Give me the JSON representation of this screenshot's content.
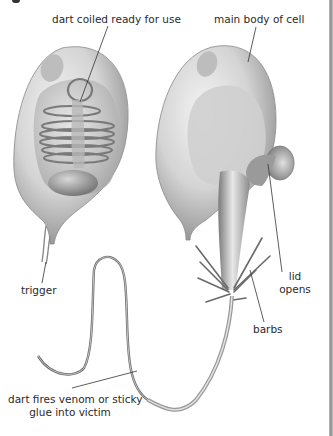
{
  "diagram": {
    "labels": {
      "dart_coiled": "dart coiled ready for use",
      "main_body": "main body of cell",
      "trigger": "trigger",
      "lid_line1": "lid",
      "lid_line2": "opens",
      "barbs": "barbs",
      "dart_fires_line1": "dart fires venom or sticky",
      "dart_fires_line2": "glue into victim"
    },
    "figures": [
      {
        "name": "unfired-cell",
        "state": "dart coiled inside cell"
      },
      {
        "name": "fired-cell",
        "state": "lid open, dart ejected with barbs"
      }
    ],
    "colors": {
      "background": "#ffffff",
      "text": "#2a2a2a",
      "leader_line": "#333333",
      "cell_fill": "#d9d9d9",
      "cell_shadow": "#8c8c8c",
      "page_edge": "#9a9a9a"
    }
  }
}
